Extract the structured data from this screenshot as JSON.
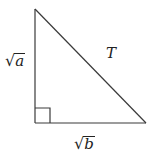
{
  "diagram": {
    "type": "right-triangle",
    "vertices": {
      "top": [
        35,
        9
      ],
      "right_angle": [
        35,
        123
      ],
      "bottom_right": [
        146,
        123
      ]
    },
    "right_angle_marker_size": 15,
    "colors": {
      "stroke": "#3a3a3a",
      "text": "#222222",
      "background": "#ffffff"
    },
    "labels": {
      "vertical_leg": {
        "radical": "√",
        "radicand": "a"
      },
      "horizontal_leg": {
        "radical": "√",
        "radicand": "b"
      },
      "hypotenuse": "T"
    }
  }
}
